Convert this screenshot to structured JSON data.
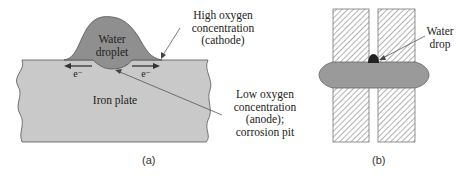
{
  "panel_a": {
    "caption": "(a)",
    "droplet_label_line1": "Water",
    "droplet_label_line2": "droplet",
    "plate_label": "Iron plate",
    "electron_left": "e⁻",
    "electron_right": "e⁻",
    "high_oxygen": {
      "line1": "High oxygen",
      "line2": "concentration",
      "line3": "(cathode)"
    },
    "low_oxygen": {
      "line1": "Low oxygen",
      "line2": "concentration",
      "line3": "(anode);",
      "line4": "corrosion pit"
    },
    "colors": {
      "plate": "#c9c9c9",
      "droplet": "#8f8f8f",
      "outline": "#555555"
    }
  },
  "panel_b": {
    "caption": "(b)",
    "drop_label_line1": "Water",
    "drop_label_line2": "drop",
    "colors": {
      "bar": "#9a9a9a",
      "drop": "#222222",
      "hatch": "#666666"
    }
  }
}
